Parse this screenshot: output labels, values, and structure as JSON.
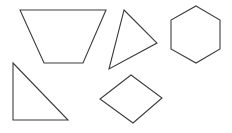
{
  "canvas": {
    "width": 232,
    "height": 133,
    "background_color": "#ffffff",
    "stroke_color": "#3c3c3c",
    "stroke_width": 1.1,
    "fill": "none",
    "description": "Five unfilled black-outline geometric polygons on a plain white background"
  },
  "shapes": [
    {
      "id": "trapezoid",
      "name": "trapezoid",
      "sides": 4,
      "points": "20,10 106,10 83,63 44,63",
      "bbox": {
        "x": 20,
        "y": 10,
        "width": 86,
        "height": 53
      },
      "position": "top-left"
    },
    {
      "id": "triangle-scalene",
      "name": "scalene-triangle",
      "sides": 3,
      "points": "124,10 157,43 109,69",
      "bbox": {
        "x": 109,
        "y": 10,
        "width": 48,
        "height": 59
      },
      "position": "top-center"
    },
    {
      "id": "hexagon",
      "name": "hexagon",
      "sides": 6,
      "points": "196,6 220,20 220,49 196,63 171,49 171,20",
      "bbox": {
        "x": 171,
        "y": 6,
        "width": 49,
        "height": 57
      },
      "position": "top-right"
    },
    {
      "id": "triangle-right",
      "name": "right-triangle",
      "sides": 3,
      "points": "13,63 68,120 13,120",
      "bbox": {
        "x": 13,
        "y": 63,
        "width": 55,
        "height": 57
      },
      "position": "bottom-left"
    },
    {
      "id": "rhombus",
      "name": "rhombus",
      "sides": 4,
      "points": "131,75 162,98 133,123 100,99",
      "bbox": {
        "x": 100,
        "y": 75,
        "width": 62,
        "height": 48
      },
      "position": "bottom-center"
    }
  ]
}
